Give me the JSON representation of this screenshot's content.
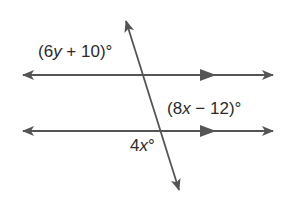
{
  "diagram": {
    "type": "parallel-lines-transversal",
    "line_color": "#555555",
    "lines": [
      {
        "name": "top-parallel-line",
        "from": [
          23,
          75
        ],
        "to": [
          273,
          75
        ],
        "parallel_marker_at": 208
      },
      {
        "name": "bottom-parallel-line",
        "from": [
          23,
          131
        ],
        "to": [
          273,
          131
        ],
        "parallel_marker_at": 208
      },
      {
        "name": "transversal",
        "from": [
          126,
          20
        ],
        "to": [
          180,
          192
        ]
      }
    ],
    "labels": {
      "angle_top": {
        "prefix": "(6",
        "var": "y",
        "suffix": " + 10)°"
      },
      "angle_right": {
        "prefix": "(8",
        "var": "x",
        "suffix": " − 12)°"
      },
      "angle_bottom": {
        "prefix": "4",
        "var": "x",
        "suffix": "°"
      }
    }
  }
}
